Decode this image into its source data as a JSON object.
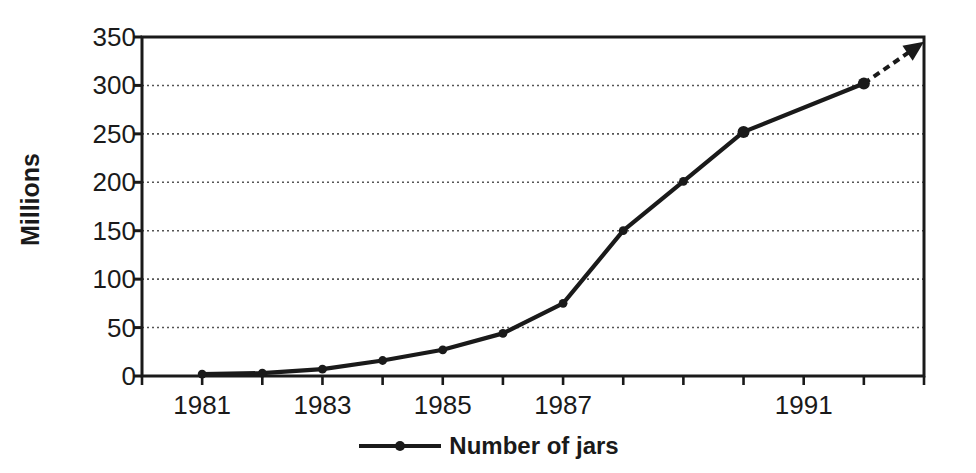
{
  "chart_data": {
    "type": "line",
    "title": "",
    "xlabel": "",
    "ylabel": "Millions",
    "x": [
      1980,
      1981,
      1982,
      1983,
      1984,
      1985,
      1986,
      1987,
      1988,
      1989,
      1990,
      1991,
      1992
    ],
    "series": [
      {
        "name": "Number of jars",
        "x": [
          1981,
          1982,
          1983,
          1984,
          1985,
          1986,
          1987,
          1988,
          1989,
          1990,
          1992
        ],
        "values": [
          2,
          3,
          7,
          16,
          27,
          44,
          75,
          150,
          201,
          252,
          302
        ]
      }
    ],
    "xlim": [
      1980,
      1993
    ],
    "ylim": [
      0,
      350
    ],
    "yticks": [
      0,
      50,
      100,
      150,
      200,
      250,
      300,
      350
    ],
    "ytick_labels": [
      "0",
      "50",
      "100",
      "150",
      "200",
      "250",
      "300",
      "350"
    ],
    "xticks": [
      1980,
      1981,
      1982,
      1983,
      1984,
      1985,
      1986,
      1987,
      1988,
      1989,
      1990,
      1991,
      1992,
      1993
    ],
    "xtick_labels": [
      "1981",
      "1983",
      "1985",
      "1987",
      "1991"
    ],
    "xtick_label_values": [
      1981,
      1983,
      1985,
      1987,
      1991
    ],
    "grid": "horizontal-dotted",
    "legend_position": "bottom-center",
    "annotations": [
      {
        "kind": "dashed-arrow",
        "from": [
          1992,
          302
        ],
        "to": [
          1993,
          345
        ],
        "label": ""
      }
    ],
    "colors": {
      "line": "#1a1a1a",
      "marker": "#1a1a1a",
      "grid": "#555555",
      "frame": "#1a1a1a",
      "background": "#ffffff"
    }
  },
  "legend": {
    "entries": [
      {
        "label": "Number of jars"
      }
    ]
  }
}
